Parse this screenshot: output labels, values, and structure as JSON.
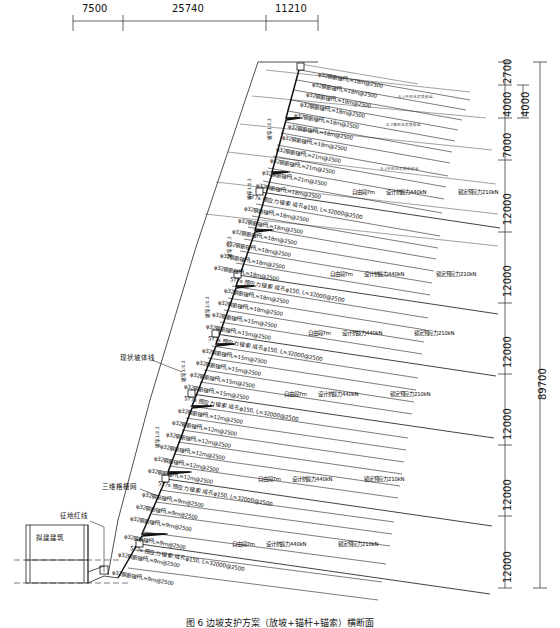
{
  "drawing": {
    "caption": "图 6  边坡支护方案（放坡+锚杆+锚索）横断面",
    "total_height_label": "89700"
  },
  "top_dimensions": {
    "values": [
      "7500",
      "25740",
      "11210"
    ],
    "ticks_x": [
      73,
      123,
      266,
      318
    ]
  },
  "right_dimensions": {
    "segments": [
      "2700",
      "4000",
      "7000",
      "12000",
      "12000",
      "12000",
      "12000",
      "12000",
      "12000"
    ],
    "overall": "89700",
    "secondary": "4000"
  },
  "leaders": {
    "existing_slope": "现状坡体线",
    "geogrid": "三维格栅网",
    "red_line": "征地红线",
    "building": "拟建建筑"
  },
  "slope_rates": [
    "坡率1:0.3",
    "坡率1:0.3",
    "坡率1:0.3",
    "坡率1:0.3",
    "坡率1:0.3",
    "坡率1:0.3"
  ],
  "soil_layers": [
    "②-1中风化泥质砂岩",
    "②-2强风化泥质砂岩",
    "③-1中风化泥质粉砂岩"
  ],
  "anchor_rows": [
    {
      "text": "φ32钢筋锚杆L=18m@2500",
      "x": 318,
      "y": 72,
      "rot": 10.5
    },
    {
      "text": "φ32钢筋锚杆L=18m@2500",
      "x": 312,
      "y": 82,
      "rot": 10.5
    },
    {
      "text": "φ32钢筋锚杆L=18m@2500",
      "x": 306,
      "y": 92,
      "rot": 10.5
    },
    {
      "text": "φ32钢筋锚杆L=18m@2500",
      "x": 300,
      "y": 102,
      "rot": 10.5
    },
    {
      "text": "φ32钢筋锚杆L=18m@2500",
      "x": 294,
      "y": 113,
      "rot": 10.5
    },
    {
      "text": "φ32钢筋锚杆L=18m@2500",
      "x": 288,
      "y": 124,
      "rot": 10.5
    },
    {
      "text": "φ32钢筋锚杆L=18m@2500",
      "x": 282,
      "y": 135,
      "rot": 10.5
    },
    {
      "text": "φ32钢筋锚杆L=21m@2500",
      "x": 276,
      "y": 147,
      "rot": 10.5
    },
    {
      "text": "φ32钢筋锚杆L=21m@2500",
      "x": 270,
      "y": 158,
      "rot": 10.5
    },
    {
      "text": "φ32钢筋锚杆L=21m@2500",
      "x": 262,
      "y": 170,
      "rot": 10.5
    },
    {
      "text": "φ32钢筋锚杆L=18m@2500",
      "x": 256,
      "y": 183,
      "rot": 10.5
    },
    {
      "text": "φ32钢筋锚杆L=18m@2500",
      "x": 244,
      "y": 206,
      "rot": 10.5
    },
    {
      "text": "φ32钢筋锚杆L=18m@2500",
      "x": 238,
      "y": 218,
      "rot": 10.5
    },
    {
      "text": "φ32钢筋锚杆L=18m@2500",
      "x": 232,
      "y": 229,
      "rot": 10.5
    },
    {
      "text": "φ32钢筋锚杆L=18m@2500",
      "x": 226,
      "y": 241,
      "rot": 10.5
    },
    {
      "text": "φ32钢筋锚杆L=18m@2500",
      "x": 220,
      "y": 253,
      "rot": 10.5
    },
    {
      "text": "φ32钢筋锚杆L=18m@2500",
      "x": 214,
      "y": 265,
      "rot": 10.5
    },
    {
      "text": "φ32钢筋锚杆L=18m@2500",
      "x": 224,
      "y": 288,
      "rot": 10.5
    },
    {
      "text": "φ32钢筋锚杆L=18m@2500",
      "x": 218,
      "y": 300,
      "rot": 10.5
    },
    {
      "text": "φ32钢筋锚杆L=15m@2500",
      "x": 212,
      "y": 312,
      "rot": 10.5
    },
    {
      "text": "φ32钢筋锚杆L=15m@2500",
      "x": 206,
      "y": 324,
      "rot": 10.5
    },
    {
      "text": "φ32钢筋锚杆L=15m@2500",
      "x": 202,
      "y": 348,
      "rot": 10.5
    },
    {
      "text": "φ32钢筋锚杆L=15m@2500",
      "x": 196,
      "y": 360,
      "rot": 10.5
    },
    {
      "text": "φ32钢筋锚杆L=15m@2500",
      "x": 190,
      "y": 372,
      "rot": 10.5
    },
    {
      "text": "φ32钢筋锚杆L=15m@2500",
      "x": 184,
      "y": 384,
      "rot": 10.5
    },
    {
      "text": "φ32钢筋锚杆L=12m@2500",
      "x": 178,
      "y": 408,
      "rot": 10.5
    },
    {
      "text": "φ32钢筋锚杆L=12m@2500",
      "x": 172,
      "y": 420,
      "rot": 10.5
    },
    {
      "text": "φ32钢筋锚杆L=12m@2500",
      "x": 166,
      "y": 432,
      "rot": 10.5
    },
    {
      "text": "φ32钢筋锚杆L=12m@2500",
      "x": 160,
      "y": 444,
      "rot": 10.5
    },
    {
      "text": "φ32钢筋锚杆L=12m@2500",
      "x": 154,
      "y": 456,
      "rot": 10.5
    },
    {
      "text": "φ32钢筋锚杆L=12m@2500",
      "x": 148,
      "y": 468,
      "rot": 10.5
    },
    {
      "text": "φ32钢筋锚杆L=9m@2500",
      "x": 142,
      "y": 492,
      "rot": 10.5
    },
    {
      "text": "φ32钢筋锚杆L=9m@2500",
      "x": 136,
      "y": 504,
      "rot": 10.5
    },
    {
      "text": "φ32钢筋锚杆L=9m@2500",
      "x": 130,
      "y": 516,
      "rot": 10.5
    },
    {
      "text": "φ32钢筋锚杆L=9m@2500",
      "x": 124,
      "y": 534,
      "rot": 10.5
    },
    {
      "text": "φ32钢筋锚杆L=9m@2500",
      "x": 118,
      "y": 552,
      "rot": 10.5
    },
    {
      "text": "φ32钢筋锚杆L=9m@2500",
      "x": 112,
      "y": 570,
      "rot": 10.5
    }
  ],
  "cable_rows": [
    {
      "text": "5T7s 预应力锚索 成孔φ150, L=32000@2500",
      "x": 248,
      "y": 194,
      "rot": 10.5
    },
    {
      "text": "5T7s 预应力锚索 成孔φ150, L=32000@2500",
      "x": 230,
      "y": 277,
      "rot": 10.5
    },
    {
      "text": "5T7s 预应力锚索 成孔φ150, L=32000@2500",
      "x": 208,
      "y": 336,
      "rot": 10.5
    },
    {
      "text": "5T7s 预应力锚索 成孔φ150, L=32000@2500",
      "x": 184,
      "y": 396,
      "rot": 10.5
    },
    {
      "text": "5T7s 预应力锚索 成孔φ150, L=32000@2500",
      "x": 158,
      "y": 481,
      "rot": 10.5
    },
    {
      "text": "5T7s 预应力锚索 成孔φ150, L=32000@2500",
      "x": 130,
      "y": 546,
      "rot": 10.5
    }
  ],
  "cable_force_rows": [
    {
      "free": "自由段7m",
      "design": "设计抗拔力440kN",
      "lock": "锁定预应力210kN",
      "x": 352,
      "y": 190,
      "rot": 0
    },
    {
      "free": "自由段7m",
      "design": "设计抗拔力440kN",
      "lock": "锁定预应力210kN",
      "x": 330,
      "y": 272,
      "rot": 0
    },
    {
      "free": "自由段7m",
      "design": "设计抗拔力440kN",
      "lock": "锁定预应力210kN",
      "x": 308,
      "y": 331,
      "rot": 0
    },
    {
      "free": "自由段7m",
      "design": "设计抗拔力440kN",
      "lock": "锁定预应力210kN",
      "x": 284,
      "y": 392,
      "rot": 0
    },
    {
      "free": "自由段7m",
      "design": "设计抗拔力440kN",
      "lock": "锁定预应力210kN",
      "x": 258,
      "y": 477,
      "rot": 0
    },
    {
      "free": "自由段7m",
      "design": "设计抗拔力440kN",
      "lock": "锁定预应力210kN",
      "x": 232,
      "y": 542,
      "rot": 0
    }
  ]
}
